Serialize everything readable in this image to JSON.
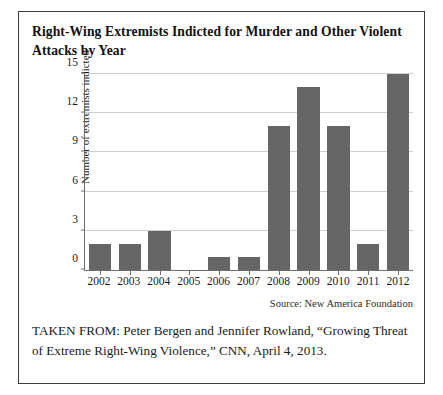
{
  "figure": {
    "title": "Right-Wing Extremists Indicted for Murder and Other Violent Attacks by Year",
    "source_note": "Source: New America Foundation",
    "caption": "TAKEN FROM: Peter Bergen and Jennifer Rowland, “Growing Threat of Extreme Right-Wing Violence,” CNN, April 4, 2013.",
    "border_color": "#3a3a3a"
  },
  "chart_data": {
    "type": "bar",
    "title": "Right-Wing Extremists Indicted for Murder and Other Violent Attacks by Year",
    "xlabel": "",
    "ylabel": "Number of extremists indicted",
    "categories": [
      "2002",
      "2003",
      "2004",
      "2005",
      "2006",
      "2007",
      "2008",
      "2009",
      "2010",
      "2011",
      "2012"
    ],
    "values": [
      2,
      2,
      3,
      0,
      1,
      1,
      11,
      14,
      11,
      2,
      15
    ],
    "ylim": [
      0,
      15
    ],
    "yticks": [
      0,
      3,
      6,
      9,
      12,
      15
    ],
    "ytick_labels": [
      "0",
      "3",
      "6",
      "9",
      "12",
      "15"
    ],
    "grid": true,
    "grid_color": "#cfcfcf",
    "bar_color": "#666666",
    "axis_color": "#6e6e6e",
    "legend": null,
    "source": "New America Foundation"
  }
}
